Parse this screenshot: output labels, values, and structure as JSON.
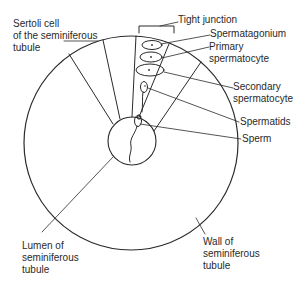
{
  "diagram": {
    "type": "labeled-cross-section",
    "subject": "Seminiferous tubule",
    "stroke_color": "#2a2a2a",
    "background_color": "#ffffff",
    "labels": {
      "sertoli_cell": [
        "Sertoli cell",
        "of the seminiferous",
        "tubule"
      ],
      "tight_junction": [
        "Tight junction"
      ],
      "spermatagonium": [
        "Spermatagonium"
      ],
      "primary_spermatocyte": [
        "Primary",
        "spermatocyte"
      ],
      "secondary_spermatocyte": [
        "Secondary",
        "spermatocyte"
      ],
      "spermatids": [
        "Spermatids"
      ],
      "sperm": [
        "Sperm"
      ],
      "lumen": [
        "Lumen of",
        "seminiferous",
        "tubule"
      ],
      "wall": [
        "Wall of",
        "seminiferous",
        "tubule"
      ]
    },
    "structures": {
      "outer_wall_circle": {
        "cx": 131,
        "cy": 143,
        "r": 107
      },
      "lumen_circle": {
        "cx": 132,
        "cy": 141,
        "r": 24
      },
      "cells": [
        {
          "name": "spermatagonium",
          "cx": 152,
          "cy": 45,
          "rx": 10,
          "ry": 4.5
        },
        {
          "name": "primary-spermatocyte",
          "cx": 151,
          "cy": 57,
          "rx": 11,
          "ry": 5
        },
        {
          "name": "secondary-spermatocyte",
          "cx": 150,
          "cy": 70,
          "rx": 14,
          "ry": 6
        }
      ]
    }
  }
}
